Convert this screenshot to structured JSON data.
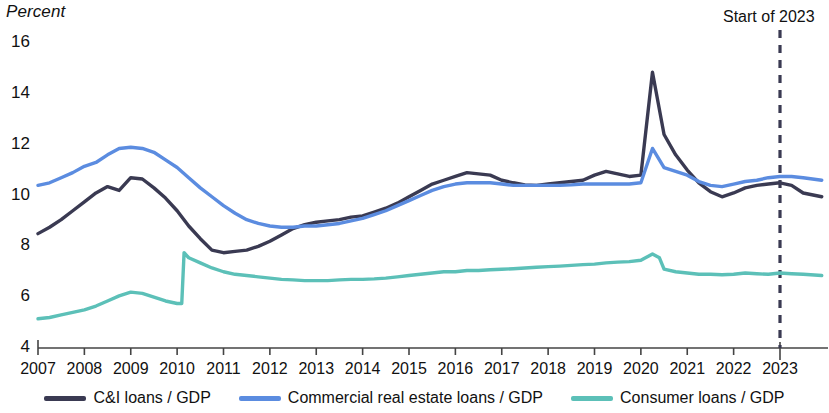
{
  "chart_data": {
    "type": "line",
    "title": "",
    "ylabel": "Percent",
    "xlabel": "",
    "ylim": [
      4,
      16
    ],
    "yticks": [
      4,
      6,
      8,
      10,
      12,
      14,
      16
    ],
    "xlim": [
      2007,
      2023.9
    ],
    "xticks": [
      "2007",
      "2008",
      "2009",
      "2010",
      "2011",
      "2012",
      "2013",
      "2014",
      "2015",
      "2016",
      "2017",
      "2018",
      "2019",
      "2020",
      "2021",
      "2022",
      "2023"
    ],
    "grid": false,
    "legend_position": "bottom",
    "annotations": [
      {
        "text": "Start of 2023",
        "x": 2023,
        "style": "dashed-vertical-line",
        "color": "#3a3a52"
      }
    ],
    "series": [
      {
        "name": "C&I loans / GDP",
        "color": "#3a3a52",
        "x": [
          2007.0,
          2007.25,
          2007.5,
          2007.75,
          2008.0,
          2008.25,
          2008.5,
          2008.75,
          2009.0,
          2009.25,
          2009.5,
          2009.75,
          2010.0,
          2010.25,
          2010.5,
          2010.75,
          2011.0,
          2011.25,
          2011.5,
          2011.75,
          2012.0,
          2012.25,
          2012.5,
          2012.75,
          2013.0,
          2013.25,
          2013.5,
          2013.75,
          2014.0,
          2014.25,
          2014.5,
          2014.75,
          2015.0,
          2015.25,
          2015.5,
          2015.75,
          2016.0,
          2016.25,
          2016.5,
          2016.75,
          2017.0,
          2017.25,
          2017.5,
          2017.75,
          2018.0,
          2018.25,
          2018.5,
          2018.75,
          2019.0,
          2019.25,
          2019.5,
          2019.75,
          2020.0,
          2020.25,
          2020.5,
          2020.75,
          2021.0,
          2021.25,
          2021.5,
          2021.75,
          2022.0,
          2022.25,
          2022.5,
          2022.75,
          2023.0,
          2023.25,
          2023.5,
          2023.9
        ],
        "y": [
          8.5,
          8.75,
          9.05,
          9.4,
          9.75,
          10.1,
          10.35,
          10.2,
          10.7,
          10.65,
          10.3,
          9.9,
          9.4,
          8.8,
          8.3,
          7.85,
          7.75,
          7.8,
          7.85,
          8.0,
          8.2,
          8.45,
          8.7,
          8.85,
          8.95,
          9.0,
          9.05,
          9.15,
          9.2,
          9.35,
          9.5,
          9.7,
          9.95,
          10.2,
          10.45,
          10.6,
          10.75,
          10.9,
          10.85,
          10.8,
          10.6,
          10.5,
          10.42,
          10.4,
          10.45,
          10.5,
          10.55,
          10.6,
          10.8,
          10.95,
          10.85,
          10.75,
          10.8,
          14.85,
          12.4,
          11.6,
          11.0,
          10.5,
          10.15,
          9.95,
          10.1,
          10.3,
          10.4,
          10.45,
          10.5,
          10.4,
          10.1,
          9.95
        ]
      },
      {
        "name": "Commercial real estate loans / GDP",
        "color": "#5b8ce0",
        "x": [
          2007.0,
          2007.25,
          2007.5,
          2007.75,
          2008.0,
          2008.25,
          2008.5,
          2008.75,
          2009.0,
          2009.25,
          2009.5,
          2009.75,
          2010.0,
          2010.25,
          2010.5,
          2010.75,
          2011.0,
          2011.25,
          2011.5,
          2011.75,
          2012.0,
          2012.25,
          2012.5,
          2012.75,
          2013.0,
          2013.25,
          2013.5,
          2013.75,
          2014.0,
          2014.25,
          2014.5,
          2014.75,
          2015.0,
          2015.25,
          2015.5,
          2015.75,
          2016.0,
          2016.25,
          2016.5,
          2016.75,
          2017.0,
          2017.25,
          2017.5,
          2017.75,
          2018.0,
          2018.25,
          2018.5,
          2018.75,
          2019.0,
          2019.25,
          2019.5,
          2019.75,
          2020.0,
          2020.25,
          2020.5,
          2020.75,
          2021.0,
          2021.25,
          2021.5,
          2021.75,
          2022.0,
          2022.25,
          2022.5,
          2022.75,
          2023.0,
          2023.25,
          2023.5,
          2023.9
        ],
        "y": [
          10.4,
          10.5,
          10.7,
          10.9,
          11.15,
          11.3,
          11.6,
          11.85,
          11.9,
          11.85,
          11.7,
          11.4,
          11.1,
          10.7,
          10.3,
          9.95,
          9.6,
          9.3,
          9.05,
          8.9,
          8.8,
          8.75,
          8.75,
          8.8,
          8.8,
          8.85,
          8.9,
          9.0,
          9.1,
          9.25,
          9.4,
          9.6,
          9.8,
          10.0,
          10.2,
          10.35,
          10.45,
          10.5,
          10.5,
          10.5,
          10.45,
          10.4,
          10.4,
          10.4,
          10.4,
          10.4,
          10.42,
          10.45,
          10.45,
          10.45,
          10.45,
          10.45,
          10.5,
          11.85,
          11.1,
          10.95,
          10.8,
          10.55,
          10.4,
          10.35,
          10.45,
          10.55,
          10.6,
          10.7,
          10.75,
          10.75,
          10.7,
          10.6
        ]
      },
      {
        "name": "Consumer loans / GDP",
        "color": "#5cc0b8",
        "x": [
          2007.0,
          2007.25,
          2007.5,
          2007.75,
          2008.0,
          2008.25,
          2008.5,
          2008.75,
          2009.0,
          2009.25,
          2009.5,
          2009.75,
          2010.0,
          2010.1,
          2010.15,
          2010.25,
          2010.5,
          2010.75,
          2011.0,
          2011.25,
          2011.5,
          2011.75,
          2012.0,
          2012.25,
          2012.5,
          2012.75,
          2013.0,
          2013.25,
          2013.5,
          2013.75,
          2014.0,
          2014.25,
          2014.5,
          2014.75,
          2015.0,
          2015.25,
          2015.5,
          2015.75,
          2016.0,
          2016.25,
          2016.5,
          2016.75,
          2017.0,
          2017.25,
          2017.5,
          2017.75,
          2018.0,
          2018.25,
          2018.5,
          2018.75,
          2019.0,
          2019.25,
          2019.5,
          2019.75,
          2020.0,
          2020.25,
          2020.4,
          2020.5,
          2020.75,
          2021.0,
          2021.25,
          2021.5,
          2021.75,
          2022.0,
          2022.25,
          2022.5,
          2022.75,
          2023.0,
          2023.25,
          2023.5,
          2023.9
        ],
        "y": [
          5.15,
          5.2,
          5.3,
          5.4,
          5.5,
          5.65,
          5.85,
          6.05,
          6.2,
          6.15,
          6.0,
          5.85,
          5.75,
          5.75,
          7.75,
          7.55,
          7.35,
          7.15,
          7.0,
          6.9,
          6.85,
          6.8,
          6.75,
          6.7,
          6.68,
          6.65,
          6.65,
          6.65,
          6.68,
          6.7,
          6.7,
          6.72,
          6.75,
          6.8,
          6.85,
          6.9,
          6.95,
          7.0,
          7.0,
          7.05,
          7.05,
          7.08,
          7.1,
          7.12,
          7.15,
          7.18,
          7.2,
          7.22,
          7.25,
          7.28,
          7.3,
          7.35,
          7.38,
          7.4,
          7.45,
          7.7,
          7.55,
          7.1,
          7.0,
          6.95,
          6.9,
          6.9,
          6.88,
          6.9,
          6.95,
          6.92,
          6.9,
          6.95,
          6.92,
          6.9,
          6.85
        ]
      }
    ]
  },
  "axis": {
    "y_title": "Percent",
    "yticks": [
      "16",
      "14",
      "12",
      "10",
      "8",
      "6",
      "4"
    ],
    "xticks": [
      "2007",
      "2008",
      "2009",
      "2010",
      "2011",
      "2012",
      "2013",
      "2014",
      "2015",
      "2016",
      "2017",
      "2018",
      "2019",
      "2020",
      "2021",
      "2022",
      "2023"
    ]
  },
  "annotation": {
    "start_of_2023": "Start of 2023"
  },
  "legend": {
    "items": [
      {
        "label": "C&I loans / GDP",
        "color": "#3a3a52"
      },
      {
        "label": "Commercial real estate loans / GDP",
        "color": "#5b8ce0"
      },
      {
        "label": "Consumer loans / GDP",
        "color": "#5cc0b8"
      }
    ]
  }
}
